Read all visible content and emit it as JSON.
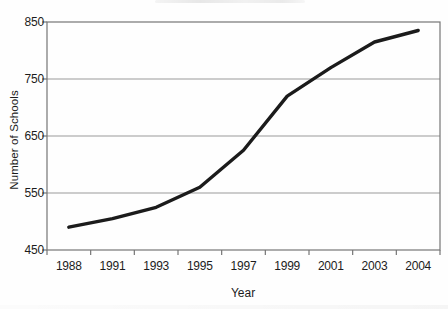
{
  "figure": {
    "background_color": "#fefefe",
    "text_color": "#1c1c1c"
  },
  "chart_data": {
    "type": "line",
    "title": "",
    "xlabel": "Year",
    "ylabel": "Number of Schools",
    "categories": [
      "1988",
      "1991",
      "1993",
      "1995",
      "1997",
      "1999",
      "2001",
      "2003",
      "2004"
    ],
    "values": [
      490,
      505,
      525,
      560,
      625,
      720,
      770,
      815,
      835
    ],
    "ylim": [
      450,
      850
    ],
    "yticks": [
      450,
      550,
      650,
      750,
      850
    ],
    "grid": "horizontal",
    "legend": "none",
    "line_color": "#1b1b1b",
    "grid_color": "#9a9a9a",
    "axis_color": "#757575"
  }
}
